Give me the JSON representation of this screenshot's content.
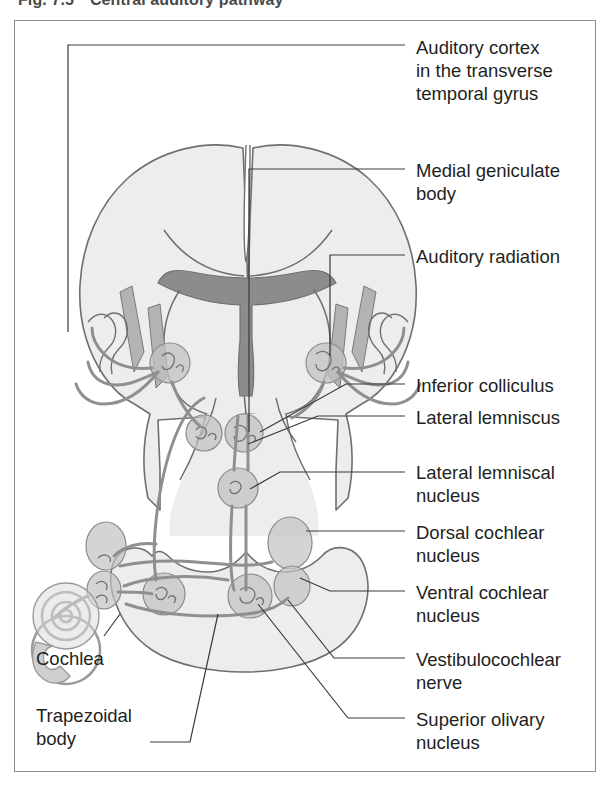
{
  "figure": {
    "number": "Fig. 7.5",
    "title": "Central auditory pathway",
    "frame_color": "#8d8d8d"
  },
  "colors": {
    "tissue_fill": "#ededed",
    "tissue_stroke": "#6f6f6f",
    "dark_structure": "#8c8c8c",
    "mid_structure": "#b3b3b3",
    "nucleus_fill": "#c2c2c2",
    "tract_stroke": "#8f8f8f",
    "leader_line": "#3a3a3a",
    "text": "#231f20"
  },
  "labels_right": [
    {
      "id": "auditory-cortex",
      "text": "Auditory cortex\nin the transverse\ntemporal gyrus",
      "x": 416,
      "y": 36
    },
    {
      "id": "medial-geniculate-body",
      "text": "Medial geniculate\nbody",
      "x": 416,
      "y": 159
    },
    {
      "id": "auditory-radiation",
      "text": "Auditory radiation",
      "x": 416,
      "y": 245
    },
    {
      "id": "inferior-colliculus",
      "text": "Inferior colliculus",
      "x": 416,
      "y": 374
    },
    {
      "id": "lateral-lemniscus",
      "text": "Lateral lemniscus",
      "x": 416,
      "y": 406
    },
    {
      "id": "lateral-lemniscal-nucleus",
      "text": "Lateral lemniscal\nnucleus",
      "x": 416,
      "y": 461
    },
    {
      "id": "dorsal-cochlear-nucleus",
      "text": "Dorsal cochlear\nnucleus",
      "x": 416,
      "y": 521
    },
    {
      "id": "ventral-cochlear-nucleus",
      "text": "Ventral cochlear\nnucleus",
      "x": 416,
      "y": 581
    },
    {
      "id": "vestibulocochlear-nerve",
      "text": "Vestibulocochlear\nnerve",
      "x": 416,
      "y": 648
    },
    {
      "id": "superior-olivary-nucleus",
      "text": "Superior olivary\nnucleus",
      "x": 416,
      "y": 708
    }
  ],
  "labels_left": [
    {
      "id": "cochlea",
      "text": "Cochlea",
      "x": 36,
      "y": 647
    },
    {
      "id": "trapezoidal-body",
      "text": "Trapezoidal\nbody",
      "x": 36,
      "y": 704
    }
  ],
  "anatomy_parts": [
    "cerebral-hemispheres",
    "corpus-callosum",
    "third-ventricle",
    "auditory-radiation-fibers",
    "medial-geniculate-body",
    "inferior-colliculus",
    "lateral-lemniscal-nucleus",
    "dorsal-cochlear-nucleus",
    "ventral-cochlear-nucleus",
    "superior-olivary-nucleus",
    "trapezoid-body",
    "vestibulocochlear-nerve",
    "cochlea-spiral",
    "brainstem-medulla"
  ]
}
